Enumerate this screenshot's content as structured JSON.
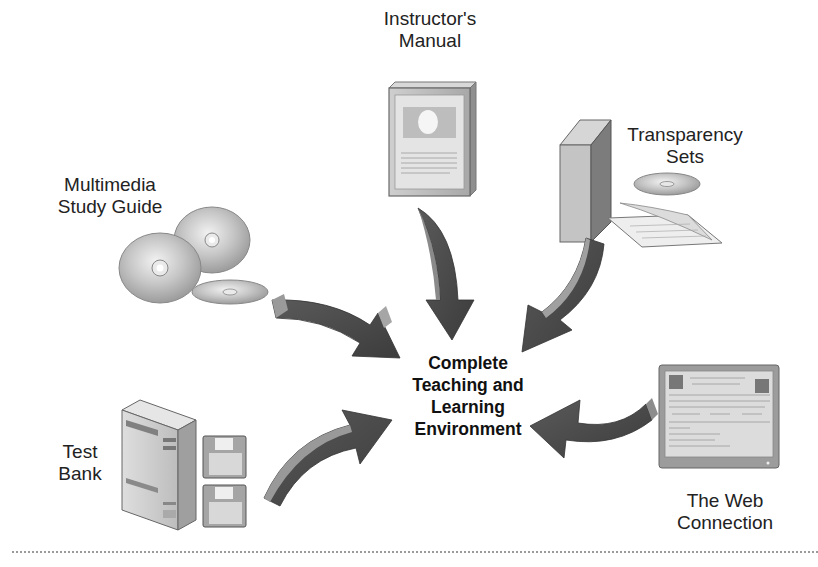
{
  "diagram": {
    "center": {
      "lines": [
        "Complete",
        "Teaching and",
        "Learning",
        "Environment"
      ]
    },
    "components": [
      {
        "id": "instructors-manual",
        "lines": [
          "Instructor's",
          "Manual"
        ],
        "icon": "book-icon"
      },
      {
        "id": "transparency-sets",
        "lines": [
          "Transparency",
          "Sets"
        ],
        "icon": "binder-cd-icon"
      },
      {
        "id": "multimedia-study-guide",
        "lines": [
          "Multimedia",
          "Study Guide"
        ],
        "icon": "cd-stack-icon"
      },
      {
        "id": "test-bank",
        "lines": [
          "Test",
          "Bank"
        ],
        "icon": "computer-tower-icon"
      },
      {
        "id": "web-connection",
        "lines": [
          "The Web",
          "Connection"
        ],
        "icon": "monitor-icon"
      }
    ],
    "arrows": [
      {
        "from": "instructors-manual",
        "to": "center",
        "direction": "down"
      },
      {
        "from": "transparency-sets",
        "to": "center",
        "direction": "down-left"
      },
      {
        "from": "multimedia-study-guide",
        "to": "center",
        "direction": "down-right"
      },
      {
        "from": "test-bank",
        "to": "center",
        "direction": "up-right"
      },
      {
        "from": "web-connection",
        "to": "center",
        "direction": "left"
      }
    ],
    "colors": {
      "arrow_dark": "#4a4a4a",
      "arrow_light": "#9a9a9a",
      "object_gray": "#b8b8b8",
      "text": "#222222"
    }
  }
}
